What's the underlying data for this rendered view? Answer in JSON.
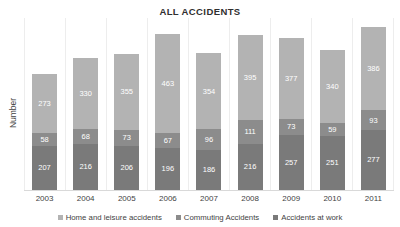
{
  "chart_data": {
    "type": "bar",
    "stacked": true,
    "title": "ALL ACCIDENTS",
    "xlabel": "",
    "ylabel": "Number",
    "categories": [
      "2003",
      "2004",
      "2005",
      "2006",
      "2007",
      "2008",
      "2009",
      "2010",
      "2011"
    ],
    "series": [
      {
        "name": "Home and leisure accidents",
        "color": "#b3b3b3",
        "values": [
          273,
          330,
          355,
          463,
          354,
          395,
          377,
          340,
          386
        ]
      },
      {
        "name": "Commuting Accidents",
        "color": "#8c8c8c",
        "values": [
          58,
          68,
          73,
          67,
          96,
          111,
          73,
          59,
          93
        ]
      },
      {
        "name": "Accidents at work",
        "color": "#7a7a7a",
        "values": [
          207,
          216,
          206,
          196,
          186,
          216,
          257,
          251,
          277
        ]
      }
    ],
    "stack_order_bottom_to_top": [
      "Accidents at work",
      "Commuting Accidents",
      "Home and leisure accidents"
    ],
    "totals": [
      538,
      614,
      634,
      726,
      636,
      722,
      707,
      650,
      756
    ],
    "ylim": [
      0,
      800
    ],
    "grid": "vertical-category-separators",
    "legend_position": "bottom",
    "axis_ticks_visible": false
  },
  "legend": {
    "items": [
      {
        "label": "Home and leisure accidents",
        "color": "#b3b3b3"
      },
      {
        "label": "Commuting Accidents",
        "color": "#8c8c8c"
      },
      {
        "label": "Accidents at work",
        "color": "#7a7a7a"
      }
    ]
  }
}
